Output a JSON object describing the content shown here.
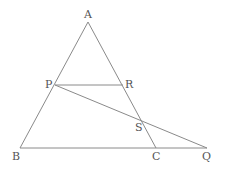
{
  "diagram": {
    "type": "geometry",
    "line_color": "#8a8a8a",
    "label_color": "#555555",
    "points": {
      "A": {
        "label": "A",
        "x": 88,
        "y": 22
      },
      "B": {
        "label": "B",
        "x": 20,
        "y": 148
      },
      "C": {
        "label": "C",
        "x": 156,
        "y": 148
      },
      "Q": {
        "label": "Q",
        "x": 207,
        "y": 148
      },
      "P": {
        "label": "P",
        "x": 55,
        "y": 85
      },
      "R": {
        "label": "R",
        "x": 123,
        "y": 85
      },
      "S": {
        "label": "S",
        "x": 142,
        "y": 120
      }
    },
    "segments": [
      [
        "A",
        "B"
      ],
      [
        "A",
        "C"
      ],
      [
        "B",
        "Q"
      ],
      [
        "P",
        "R"
      ],
      [
        "P",
        "Q"
      ]
    ]
  }
}
